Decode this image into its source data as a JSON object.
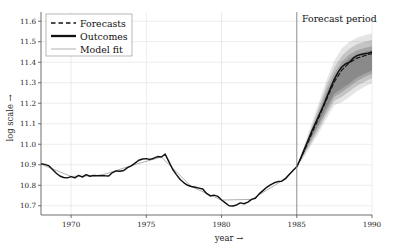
{
  "chart_data": {
    "type": "line",
    "title": "",
    "xlabel": "year →",
    "ylabel": "log scale →",
    "xlim": [
      1968.0,
      1990.0
    ],
    "ylim": [
      10.655,
      11.645
    ],
    "xticks": [
      1970,
      1975,
      1980,
      1985,
      1990
    ],
    "xtick_labels": [
      "1970",
      "1975",
      "1980",
      "1985",
      "1990"
    ],
    "yticks": [
      10.7,
      10.8,
      10.9,
      11.0,
      11.1,
      11.2,
      11.3,
      11.4,
      11.5,
      11.6
    ],
    "ytick_labels": [
      "10.7",
      "10.8",
      "10.9",
      "11.0",
      "11.1",
      "11.2",
      "11.3",
      "11.4",
      "11.5",
      "11.6"
    ],
    "grid": true,
    "grid_color": "#d8d8d8",
    "legend_position": "upper-left",
    "legend_entries": [
      {
        "label": "Forecasts",
        "style": "dashed",
        "color": "#111111",
        "width": 1.3
      },
      {
        "label": "Outcomes",
        "style": "solid",
        "color": "#111111",
        "width": 2.0
      },
      {
        "label": "Model fit",
        "style": "solid",
        "color": "#9a9a9a",
        "width": 0.8
      }
    ],
    "annotations": [
      {
        "text": "Forecast period",
        "x": 1985.2,
        "y": 11.62,
        "type": "label"
      },
      {
        "text": "",
        "x": 1985.0,
        "type": "vline",
        "color": "#8a8a8a"
      }
    ],
    "forecast_start": 1985.0,
    "fan_color_dark": "#707070",
    "fan_color_light": "#cfcfcf",
    "series": [
      {
        "name": "Outcomes",
        "color": "#111111",
        "style": "solid",
        "x": [
          1968.0,
          1968.25,
          1968.5,
          1968.75,
          1969.0,
          1969.25,
          1969.5,
          1969.75,
          1970.0,
          1970.25,
          1970.5,
          1970.75,
          1971.0,
          1971.25,
          1971.5,
          1971.75,
          1972.0,
          1972.25,
          1972.5,
          1972.75,
          1973.0,
          1973.25,
          1973.5,
          1973.75,
          1974.0,
          1974.25,
          1974.5,
          1974.75,
          1975.0,
          1975.25,
          1975.5,
          1975.75,
          1976.0,
          1976.25,
          1976.5,
          1976.75,
          1977.0,
          1977.25,
          1977.5,
          1977.75,
          1978.0,
          1978.25,
          1978.5,
          1978.75,
          1979.0,
          1979.25,
          1979.5,
          1979.75,
          1980.0,
          1980.25,
          1980.5,
          1980.75,
          1981.0,
          1981.25,
          1981.5,
          1981.75,
          1982.0,
          1982.25,
          1982.5,
          1982.75,
          1983.0,
          1983.25,
          1983.5,
          1983.75,
          1984.0,
          1984.25,
          1984.5,
          1984.75,
          1985.0,
          1985.25,
          1985.5,
          1985.75,
          1986.0,
          1986.25,
          1986.5,
          1986.75,
          1987.0,
          1987.25,
          1987.5,
          1987.75,
          1988.0,
          1988.25,
          1988.5,
          1988.75,
          1989.0,
          1989.25,
          1989.5,
          1989.75,
          1990.0
        ],
        "y": [
          10.905,
          10.902,
          10.896,
          10.878,
          10.86,
          10.845,
          10.838,
          10.836,
          10.842,
          10.836,
          10.848,
          10.84,
          10.852,
          10.844,
          10.848,
          10.846,
          10.848,
          10.846,
          10.845,
          10.862,
          10.87,
          10.868,
          10.872,
          10.886,
          10.895,
          10.908,
          10.922,
          10.928,
          10.93,
          10.926,
          10.932,
          10.94,
          10.938,
          10.952,
          10.915,
          10.878,
          10.852,
          10.828,
          10.812,
          10.8,
          10.794,
          10.79,
          10.786,
          10.782,
          10.76,
          10.748,
          10.752,
          10.746,
          10.728,
          10.714,
          10.7,
          10.699,
          10.704,
          10.714,
          10.71,
          10.718,
          10.731,
          10.737,
          10.758,
          10.774,
          10.79,
          10.802,
          10.812,
          10.818,
          10.82,
          10.832,
          10.852,
          10.872,
          10.89,
          10.93,
          10.975,
          11.02,
          11.065,
          11.105,
          11.145,
          11.185,
          11.23,
          11.275,
          11.318,
          11.352,
          11.378,
          11.392,
          11.4,
          11.42,
          11.432,
          11.438,
          11.441,
          11.444,
          11.45
        ]
      },
      {
        "name": "Model fit",
        "color": "#9a9a9a",
        "style": "solid",
        "x": [
          1968.0,
          1970.0,
          1972.0,
          1974.0,
          1976.0,
          1978.0,
          1980.0,
          1982.0,
          1984.0,
          1985.0
        ],
        "y": [
          10.903,
          10.843,
          10.848,
          10.896,
          10.938,
          10.793,
          10.728,
          10.731,
          10.821,
          10.89
        ]
      },
      {
        "name": "Forecasts",
        "color": "#111111",
        "style": "dashed",
        "x": [
          1985.0,
          1985.5,
          1986.0,
          1986.5,
          1987.0,
          1987.5,
          1988.0,
          1988.5,
          1989.0,
          1989.5,
          1990.0
        ],
        "y": [
          10.89,
          10.968,
          11.052,
          11.136,
          11.222,
          11.305,
          11.362,
          11.398,
          11.42,
          11.432,
          11.442
        ]
      }
    ],
    "fan_bands": [
      {
        "level": "outer",
        "opacity": 0.18,
        "upper": [
          10.895,
          10.995,
          11.105,
          11.21,
          11.318,
          11.408,
          11.468,
          11.5,
          11.52,
          11.532,
          11.54
        ],
        "lower": [
          10.885,
          10.94,
          11.0,
          11.06,
          11.128,
          11.19,
          11.205,
          11.23,
          11.258,
          11.28,
          11.298
        ]
      },
      {
        "level": "mid",
        "opacity": 0.28,
        "upper": [
          10.893,
          10.985,
          11.088,
          11.188,
          11.292,
          11.375,
          11.432,
          11.466,
          11.488,
          11.5,
          11.508
        ],
        "lower": [
          10.887,
          10.948,
          11.012,
          11.078,
          11.148,
          11.212,
          11.232,
          11.258,
          11.285,
          11.305,
          11.322
        ]
      },
      {
        "level": "inner",
        "opacity": 0.38,
        "upper": [
          10.892,
          10.978,
          11.072,
          11.168,
          11.268,
          11.348,
          11.404,
          11.438,
          11.458,
          11.47,
          11.478
        ],
        "lower": [
          10.888,
          10.956,
          11.026,
          11.094,
          11.166,
          11.232,
          11.255,
          11.282,
          11.308,
          11.328,
          11.344
        ]
      },
      {
        "level": "core",
        "opacity": 0.5,
        "upper": [
          10.891,
          10.972,
          11.06,
          11.152,
          11.248,
          11.328,
          11.384,
          11.418,
          11.438,
          11.45,
          11.458
        ],
        "lower": [
          10.889,
          10.962,
          11.038,
          11.108,
          11.182,
          11.248,
          11.272,
          11.298,
          11.325,
          11.344,
          11.36
        ]
      }
    ]
  },
  "labels": {
    "xlabel": "year →",
    "ylabel": "log scale →",
    "forecast_period": "Forecast period",
    "legend": {
      "forecasts": "Forecasts",
      "outcomes": "Outcomes",
      "model_fit": "Model fit"
    }
  }
}
